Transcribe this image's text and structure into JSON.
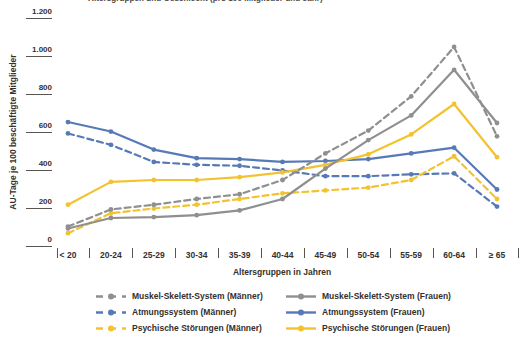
{
  "clipped_title": "Altersgruppen und Geschlecht (pro 100 Mitglieder und Jahr)",
  "y_axis": {
    "title": "AU-Tage je 100 beschäftigte Mitglieder",
    "ticks": [
      {
        "label": "1.200",
        "value": 1200
      },
      {
        "label": "1.000",
        "value": 1000
      },
      {
        "label": "800",
        "value": 800
      },
      {
        "label": "600",
        "value": 600
      },
      {
        "label": "400",
        "value": 400
      },
      {
        "label": "200",
        "value": 200
      },
      {
        "label": "0",
        "value": 0
      }
    ]
  },
  "x_axis": {
    "title": "Altersgruppen in Jahren"
  },
  "chart_data": {
    "type": "line",
    "categories": [
      "< 20",
      "20-24",
      "25-29",
      "30-34",
      "35-39",
      "40-44",
      "45-49",
      "50-54",
      "55-59",
      "60-64",
      "≥ 65"
    ],
    "ylim": [
      0,
      1200
    ],
    "grid": false,
    "legend_position": "bottom",
    "xlabel": "Altersgruppen in Jahren",
    "ylabel": "AU-Tage je 100 beschäftigte Mitglieder",
    "series": [
      {
        "id": "muskel-skelett-system-maenner",
        "name": "Muskel-Skelett-System (Männer)",
        "color": "#8f8f8f",
        "dashed": true,
        "values": [
          105,
          195,
          220,
          250,
          275,
          350,
          490,
          610,
          790,
          1050,
          580
        ]
      },
      {
        "id": "muskel-skelett-system-frauen",
        "name": "Muskel-Skelett-System (Frauen)",
        "color": "#8f8f8f",
        "dashed": false,
        "values": [
          95,
          150,
          155,
          165,
          190,
          250,
          410,
          560,
          690,
          930,
          650
        ]
      },
      {
        "id": "atmungssystem-maenner",
        "name": "Atmungssystem (Männer)",
        "color": "#567ab5",
        "dashed": true,
        "values": [
          595,
          535,
          445,
          430,
          425,
          400,
          370,
          370,
          380,
          385,
          210
        ]
      },
      {
        "id": "atmungssystem-frauen",
        "name": "Atmungssystem (Frauen)",
        "color": "#567ab5",
        "dashed": false,
        "values": [
          655,
          605,
          510,
          465,
          460,
          445,
          450,
          460,
          490,
          520,
          300
        ]
      },
      {
        "id": "psychische-stoerungen-maenner",
        "name": "Psychische Störungen (Männer)",
        "color": "#f2c32f",
        "dashed": true,
        "values": [
          70,
          175,
          200,
          220,
          250,
          280,
          295,
          310,
          350,
          475,
          250
        ]
      },
      {
        "id": "psychische-stoerungen-frauen",
        "name": "Psychische Störungen (Frauen)",
        "color": "#f2c32f",
        "dashed": false,
        "values": [
          220,
          340,
          350,
          350,
          365,
          390,
          430,
          485,
          590,
          750,
          470
        ]
      }
    ]
  },
  "colors": {
    "blue": "#567ab5",
    "gray": "#8f8f8f",
    "yellow": "#f2c32f",
    "text": "#35302c"
  }
}
